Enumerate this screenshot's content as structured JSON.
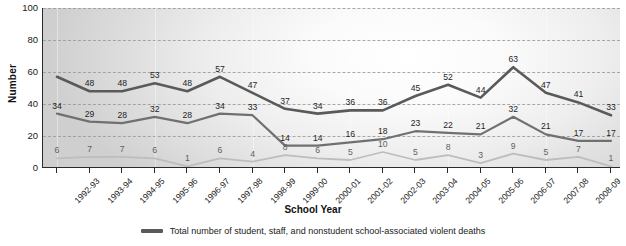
{
  "chart_data": {
    "type": "line",
    "title": "",
    "xlabel": "School Year",
    "ylabel": "Number",
    "ylim": [
      0,
      100
    ],
    "yticks": [
      0,
      20,
      40,
      60,
      80,
      100
    ],
    "grid": true,
    "legend_position": "bottom",
    "categories": [
      "1992-93",
      "1993-94",
      "1994-95",
      "1995-96",
      "1996-97",
      "1997-98",
      "1998-99",
      "1999-00",
      "2000-01",
      "2001-02",
      "2002-03",
      "2003-04",
      "2004-05",
      "2005-06",
      "2006-07",
      "2007-08",
      "2008-09",
      "2009-10"
    ],
    "series": [
      {
        "name": "Total number of student, staff, and nonstudent school-associated violent deaths",
        "color": "#5a5a5a",
        "values": [
          57,
          48,
          48,
          53,
          48,
          57,
          47,
          37,
          34,
          36,
          36,
          45,
          52,
          44,
          63,
          47,
          41,
          33
        ],
        "labels": [
          "",
          "48",
          "48",
          "53",
          "48",
          "57",
          "47",
          "37",
          "34",
          "36",
          "36",
          "45",
          "52",
          "44",
          "63",
          "47",
          "41",
          "33"
        ]
      },
      {
        "name": "series-middle",
        "color": "#707070",
        "values": [
          34,
          29,
          28,
          32,
          28,
          34,
          33,
          14,
          14,
          16,
          18,
          23,
          22,
          21,
          32,
          21,
          17,
          17
        ],
        "labels": [
          "34",
          "29",
          "28",
          "32",
          "28",
          "34",
          "33",
          "14",
          "14",
          "16",
          "18",
          "23",
          "22",
          "21",
          "32",
          "21",
          "17",
          "17"
        ]
      },
      {
        "name": "series-lower",
        "color": "#bdbdbd",
        "values": [
          6,
          7,
          7,
          6,
          1,
          6,
          4,
          8,
          6,
          5,
          10,
          5,
          8,
          3,
          9,
          5,
          7,
          1
        ],
        "labels": [
          "6",
          "7",
          "7",
          "6",
          "1",
          "6",
          "4",
          "8",
          "6",
          "5",
          "10",
          "5",
          "8",
          "3",
          "9",
          "5",
          "7",
          "1"
        ]
      }
    ]
  },
  "legend": {
    "entries": [
      {
        "label": "Total number of student, staff, and nonstudent school-associated violent deaths"
      }
    ]
  }
}
